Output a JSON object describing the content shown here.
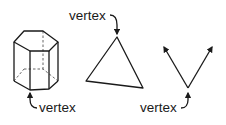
{
  "diagram": {
    "figures": [
      {
        "id": "hexagonal-prism",
        "label": "vertex"
      },
      {
        "id": "triangle",
        "label": "vertex"
      },
      {
        "id": "angle",
        "label": "vertex"
      }
    ],
    "colors": {
      "stroke": "#1a1a1a",
      "background": "#ffffff"
    }
  }
}
